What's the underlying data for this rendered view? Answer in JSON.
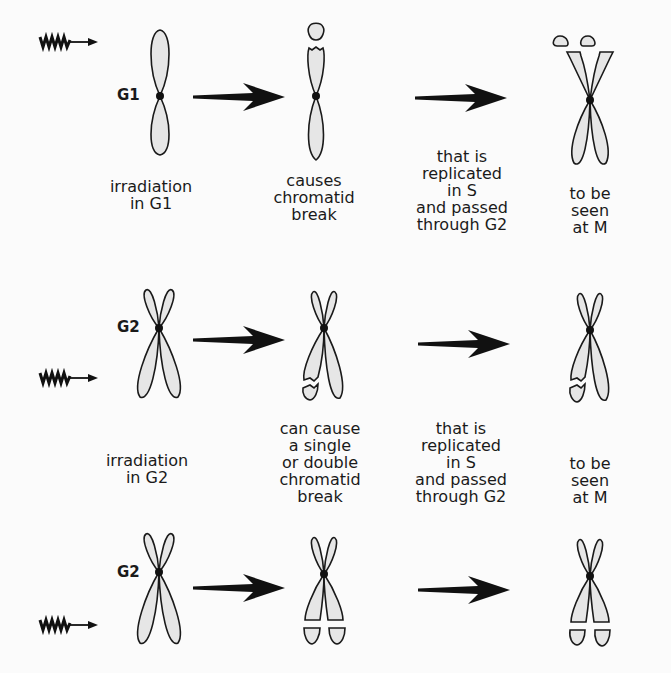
{
  "diagram": {
    "title": "",
    "colors": {
      "background": "#fbfbfb",
      "chromatid_fill": "#e6e6e6",
      "ink": "#1a1a1a"
    },
    "rows": [
      {
        "id": "g1",
        "phase_label": "G1",
        "irradiation_label": "irradiation\nin G1",
        "effect_label": "causes\nchromatid\nbreak",
        "replication_label": "that is\nreplicated\nin S\nand passed\nthrough G2",
        "outcome_label": "to be seen\nat M"
      },
      {
        "id": "g2-single",
        "phase_label": "G2",
        "irradiation_label": "irradiation\nin G2",
        "effect_label": "can cause\na single\nor double\nchromatid\nbreak",
        "replication_label": "that is\nreplicated\nin S\nand passed\nthrough G2",
        "outcome_label": "to be seen\nat M"
      },
      {
        "id": "g2-double",
        "phase_label": "G2"
      }
    ],
    "icons": {
      "radiation": "wavy-arrow-icon",
      "transition": "block-arrow-icon",
      "centromere": "dot"
    }
  }
}
